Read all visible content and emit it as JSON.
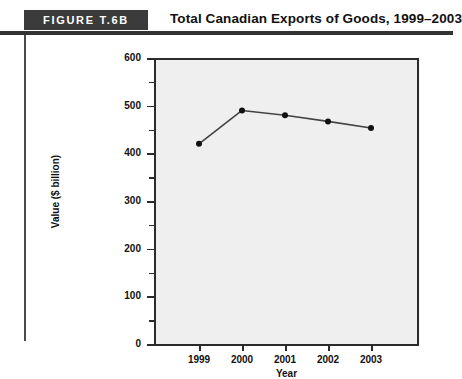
{
  "header": {
    "badge_label": "FIGURE T.6B",
    "title": "Total Canadian Exports of Goods, 1999–2003"
  },
  "chart_data": {
    "type": "line",
    "title": "Total Canadian Exports of Goods, 1999–2003",
    "xlabel": "Year",
    "ylabel": "Value ($ billion)",
    "categories": [
      "1999",
      "2000",
      "2001",
      "2002",
      "2003"
    ],
    "values": [
      420,
      490,
      480,
      467,
      453
    ],
    "series": [
      {
        "name": "Total Canadian Exports of Goods",
        "values": [
          420,
          490,
          480,
          467,
          453
        ]
      }
    ],
    "xlim": [
      1998.5,
      2003.9
    ],
    "ylim": [
      0,
      600
    ],
    "y_ticks": [
      0,
      100,
      200,
      300,
      400,
      500,
      600
    ],
    "y_tick_labels": [
      "0",
      "100",
      "200",
      "300",
      "400",
      "500",
      "600"
    ],
    "y_minor_ticks": [
      50,
      150,
      250,
      350,
      450,
      550
    ],
    "x_ticks": [
      "1999",
      "2000",
      "2001",
      "2002",
      "2003"
    ],
    "grid": false,
    "legend": "none",
    "marker": "circle",
    "line_color": "#444444",
    "marker_color": "#111111",
    "plot_background": "#efefef"
  },
  "axis": {
    "y_label_0": "0",
    "y_label_100": "100",
    "y_label_200": "200",
    "y_label_300": "300",
    "y_label_400": "400",
    "y_label_500": "500",
    "y_label_600": "600",
    "x_label_1999": "1999",
    "x_label_2000": "2000",
    "x_label_2001": "2001",
    "x_label_2002": "2002",
    "x_label_2003": "2003",
    "x_title": "Year",
    "y_title": "Value ($ billion)"
  }
}
